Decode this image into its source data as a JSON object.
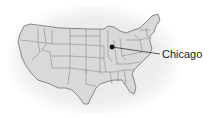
{
  "map": {
    "region": "Contiguous United States",
    "fill_color": "#d9d9d9",
    "border_color": "#707070",
    "marker": {
      "city": "Chicago",
      "label": "Chicago",
      "dot_color": "#111111"
    }
  }
}
